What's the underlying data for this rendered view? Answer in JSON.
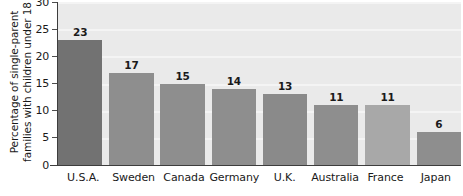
{
  "chart_data": {
    "type": "bar",
    "title": "",
    "xlabel": "",
    "ylabel": "Percentage of single-parent families with children under 18",
    "ylabel_lines": [
      "Percentage of single-parent",
      "families with children under 18"
    ],
    "categories": [
      "U.S.A.",
      "Sweden",
      "Canada",
      "Germany",
      "U.K.",
      "Australia",
      "France",
      "Japan"
    ],
    "values": [
      23,
      17,
      15,
      14,
      13,
      11,
      11,
      6
    ],
    "value_labels": [
      "23",
      "17",
      "15",
      "14",
      "13",
      "11",
      "11",
      "6"
    ],
    "bar_colors": [
      "#727272",
      "#8e8e8e",
      "#8e8e8e",
      "#8e8e8e",
      "#8a8a8a",
      "#8e8e8e",
      "#a8a8a8",
      "#8e8e8e"
    ],
    "ylim": [
      0,
      30
    ],
    "yticks": [
      30,
      25,
      20,
      15,
      10,
      5,
      0
    ],
    "ytick_labels": [
      "30",
      "25",
      "20",
      "15",
      "10",
      "5",
      "0"
    ],
    "grid": true,
    "grid_color": "#f4f4f4",
    "plot_background": "#eaeaea",
    "axis_color": "#3d3d3d",
    "legend": null
  }
}
